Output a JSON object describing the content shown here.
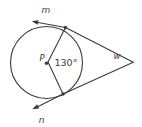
{
  "diagram": {
    "background": "#ffffff",
    "ink": "#3b3b3b",
    "text_color": "#3b3b3b",
    "labels": {
      "ray_top": "m",
      "ray_bottom": "n",
      "external_point": "w",
      "center": "P",
      "angle": "130°"
    }
  }
}
